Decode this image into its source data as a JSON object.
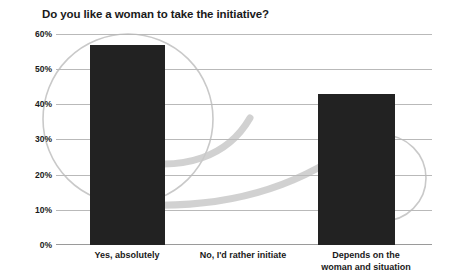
{
  "chart_data": {
    "type": "bar",
    "title": "Do you like a woman to take the initiative?",
    "xlabel": "",
    "ylabel": "",
    "categories": [
      "Yes, absolutely",
      "No, I'd rather initiate",
      "Depends on the\nwoman and situation"
    ],
    "values": [
      57,
      0,
      43
    ],
    "value_labels": [
      "57%",
      "0%",
      "43%"
    ],
    "ylim": [
      0,
      60
    ],
    "ytick_labels": [
      "60%",
      "50%",
      "40%",
      "30%",
      "20%",
      "10%",
      "0%"
    ],
    "ytick_values": [
      60,
      50,
      40,
      30,
      20,
      10,
      0
    ],
    "grid": true,
    "legend": false,
    "colors": {
      "bar": "#222222",
      "gridline": "#b9b9b9",
      "baseline": "#9a9a9a",
      "text": "#1a1a1a",
      "background": "#ffffff",
      "decor_light": "#c9c9c9",
      "decor_swoosh": "#c4c4c4"
    }
  },
  "axis": {
    "y_labels": [
      "60%",
      "50%",
      "40%",
      "30%",
      "20%",
      "10%",
      "0%"
    ],
    "x_labels": [
      {
        "line1": "Yes, absolutely",
        "line2": ""
      },
      {
        "line1": "No, I'd rather initiate",
        "line2": ""
      },
      {
        "line1": "Depends on the",
        "line2": "woman and situation"
      }
    ]
  }
}
